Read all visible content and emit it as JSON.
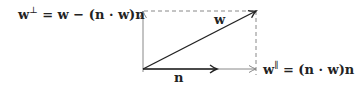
{
  "diagram": {
    "labels": {
      "perp_equation": "w⊥ = w − (n · w)n",
      "perp_lhs_base": "w",
      "perp_lhs_sup": "⊥",
      "perp_rhs": " = w − (n · w)n",
      "parallel_equation": "w∥ = (n · w)n",
      "parallel_lhs_base": "w",
      "parallel_lhs_sup": "∥",
      "parallel_rhs": " = (n · w)n",
      "w_vector": "w",
      "n_vector": "n"
    },
    "vectors": [
      {
        "name": "w",
        "style": "solid",
        "color": "#222222",
        "description": "diagonal vector from origin to upper-right corner"
      },
      {
        "name": "n",
        "style": "solid",
        "color": "#222222",
        "description": "unit normal along horizontal axis"
      },
      {
        "name": "w-parallel",
        "style": "solid-thin",
        "color": "#888888",
        "description": "horizontal projection of w"
      },
      {
        "name": "w-perp",
        "style": "solid-thin",
        "color": "#888888",
        "description": "vertical component of w"
      }
    ],
    "guides": [
      {
        "name": "top-dashed",
        "style": "dashed",
        "color": "#888888"
      },
      {
        "name": "right-dashed",
        "style": "dashed",
        "color": "#888888"
      }
    ],
    "colors": {
      "ink": "#222222",
      "light": "#888888",
      "background": "#ffffff"
    }
  }
}
